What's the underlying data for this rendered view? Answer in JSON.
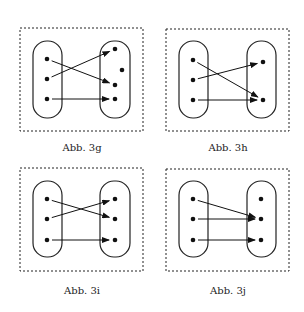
{
  "figures": [
    {
      "id": "3g",
      "caption": "Abb. 3g",
      "box": [
        20,
        28,
        123,
        103
      ],
      "left_oval": [
        33,
        41,
        29,
        77
      ],
      "right_oval": [
        100,
        41,
        30,
        77
      ],
      "left_points": [
        [
          47,
          59
        ],
        [
          47,
          79
        ],
        [
          47,
          99
        ]
      ],
      "right_points": [
        [
          115,
          49
        ],
        [
          122,
          70
        ],
        [
          115,
          85
        ],
        [
          115,
          99
        ]
      ],
      "arrows": [
        [
          0,
          2
        ],
        [
          1,
          0
        ],
        [
          2,
          3
        ]
      ],
      "caption_pos": [
        32,
        142
      ]
    },
    {
      "id": "3h",
      "caption": "Abb. 3h",
      "box": [
        166,
        29,
        123,
        102
      ],
      "left_oval": [
        179,
        41,
        29,
        77
      ],
      "right_oval": [
        247,
        41,
        29,
        77
      ],
      "left_points": [
        [
          193,
          60
        ],
        [
          193,
          80
        ],
        [
          193,
          100
        ]
      ],
      "right_points": [
        [
          263,
          62
        ],
        [
          263,
          100
        ]
      ],
      "arrows": [
        [
          0,
          1
        ],
        [
          1,
          0
        ],
        [
          2,
          1
        ]
      ],
      "caption_pos": [
        178,
        142
      ]
    },
    {
      "id": "3i",
      "caption": "Abb. 3i",
      "box": [
        20,
        168,
        123,
        103
      ],
      "left_oval": [
        33,
        181,
        29,
        76
      ],
      "right_oval": [
        100,
        181,
        30,
        76
      ],
      "left_points": [
        [
          47,
          199
        ],
        [
          47,
          219
        ],
        [
          47,
          240
        ]
      ],
      "right_points": [
        [
          115,
          199
        ],
        [
          115,
          219
        ],
        [
          115,
          240
        ]
      ],
      "arrows": [
        [
          0,
          1
        ],
        [
          1,
          0
        ],
        [
          2,
          2
        ]
      ],
      "caption_pos": [
        32,
        285
      ]
    },
    {
      "id": "3j",
      "caption": "Abb. 3j",
      "box": [
        166,
        169,
        123,
        102
      ],
      "left_oval": [
        179,
        181,
        29,
        76
      ],
      "right_oval": [
        247,
        181,
        29,
        76
      ],
      "left_points": [
        [
          193,
          199
        ],
        [
          193,
          219
        ],
        [
          193,
          240
        ]
      ],
      "right_points": [
        [
          261,
          199
        ],
        [
          261,
          219
        ],
        [
          261,
          240
        ]
      ],
      "arrows": [
        [
          0,
          1
        ],
        [
          1,
          1
        ],
        [
          2,
          2
        ]
      ],
      "caption_pos": [
        178,
        285
      ]
    }
  ]
}
